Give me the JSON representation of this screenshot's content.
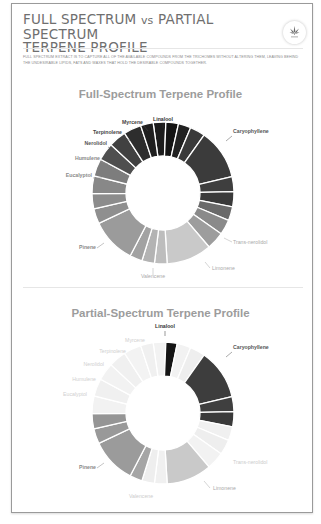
{
  "header": {
    "title_part1": "FULL SPECTRUM",
    "title_vs": "vs",
    "title_part2": "PARTIAL SPECTRUM",
    "title_line2": "TERPENE PROFILE",
    "logo_icon": "cannabis-leaf-icon",
    "description": "Full spectrum extract is to capture all of the available compounds from the trichomes without altering them, leaving behind the undesirable lipids, fats and waxes that hold the desirable compounds together."
  },
  "chart_data": [
    {
      "type": "pie",
      "variant": "donut",
      "title": "Full-Spectrum Terpene Profile",
      "start_angle_deg": -8,
      "segments": [
        {
          "label": "Linalool",
          "share": 10,
          "color": "#1c1c1c"
        },
        {
          "label": "Linalool",
          "share": 10,
          "color": "#141414"
        },
        {
          "label": "",
          "share": 10,
          "color": "#222222"
        },
        {
          "label": "",
          "share": 12,
          "color": "#3a3a3a"
        },
        {
          "label": "Caryophyllene",
          "share": 40,
          "color": "#3b3b3b"
        },
        {
          "label": "",
          "share": 12,
          "color": "#3e3e3e"
        },
        {
          "label": "",
          "share": 12,
          "color": "#3a3a3a"
        },
        {
          "label": "",
          "share": 11,
          "color": "#6a6a6a"
        },
        {
          "label": "",
          "share": 12,
          "color": "#8a8a8a"
        },
        {
          "label": "Trans-nerolidol",
          "share": 14,
          "color": "#9d9d9d"
        },
        {
          "label": "Limonene",
          "share": 36,
          "color": "#c9c9c9"
        },
        {
          "label": "",
          "share": 10,
          "color": "#bdbdbd"
        },
        {
          "label": "Valencene",
          "share": 10,
          "color": "#b3b3b3"
        },
        {
          "label": "",
          "share": 10,
          "color": "#a2a2a2"
        },
        {
          "label": "Pinene",
          "share": 36,
          "color": "#9b9b9b"
        },
        {
          "label": "",
          "share": 12,
          "color": "#8f8f8f"
        },
        {
          "label": "",
          "share": 12,
          "color": "#8c8c8c"
        },
        {
          "label": "Eucalyptol",
          "share": 14,
          "color": "#888888"
        },
        {
          "label": "Humulene",
          "share": 14,
          "color": "#7d7d7d"
        },
        {
          "label": "Nerolidol",
          "share": 14,
          "color": "#4f4f4f"
        },
        {
          "label": "Terpinolene",
          "share": 14,
          "color": "#414141"
        },
        {
          "label": "Myrcene",
          "share": 14,
          "color": "#2d2d2d"
        },
        {
          "label": "",
          "share": 10,
          "color": "#1f1f1f"
        }
      ],
      "labels": [
        {
          "text": "Linalool",
          "color": "#333333",
          "bold": true
        },
        {
          "text": "Caryophyllene",
          "color": "#555555",
          "bold": true
        },
        {
          "text": "Myrcene",
          "color": "#444444",
          "bold": true
        },
        {
          "text": "Terpinolene",
          "color": "#444444",
          "bold": true
        },
        {
          "text": "Nerolidol",
          "color": "#555555",
          "bold": true
        },
        {
          "text": "Humulene",
          "color": "#8a8a8a",
          "bold": true
        },
        {
          "text": "Eucalyptol",
          "color": "#8a8a8a",
          "bold": true
        },
        {
          "text": "Pinene",
          "color": "#8a8a8a",
          "bold": true
        },
        {
          "text": "Valencene",
          "color": "#aaaaaa",
          "bold": false
        },
        {
          "text": "Limonene",
          "color": "#aaaaaa",
          "bold": false
        },
        {
          "text": "Trans-nerolidol",
          "color": "#aaaaaa",
          "bold": false
        }
      ]
    },
    {
      "type": "pie",
      "variant": "donut",
      "title": "Partial-Spectrum Terpene Profile",
      "start_angle_deg": -8,
      "segments": [
        {
          "label": "",
          "share": 10,
          "color": "#f2f2f2"
        },
        {
          "label": "Linalool",
          "share": 9,
          "color": "#151515"
        },
        {
          "label": "",
          "share": 11,
          "color": "#f2f2f2"
        },
        {
          "label": "",
          "share": 12,
          "color": "#eeeeee"
        },
        {
          "label": "Caryophyllene",
          "share": 40,
          "color": "#3d3d3d"
        },
        {
          "label": "",
          "share": 12,
          "color": "#3f3f3f"
        },
        {
          "label": "",
          "share": 12,
          "color": "#3a3a3a"
        },
        {
          "label": "",
          "share": 11,
          "color": "#f0f0f0"
        },
        {
          "label": "",
          "share": 12,
          "color": "#eeeeee"
        },
        {
          "label": "Trans-nerolidol",
          "share": 14,
          "color": "#f2f2f2"
        },
        {
          "label": "Limonene",
          "share": 36,
          "color": "#c9c9c9"
        },
        {
          "label": "",
          "share": 10,
          "color": "#f0f0f0"
        },
        {
          "label": "Valencene",
          "share": 10,
          "color": "#eeeeee"
        },
        {
          "label": "",
          "share": 10,
          "color": "#a5a5a5"
        },
        {
          "label": "Pinene",
          "share": 36,
          "color": "#9b9b9b"
        },
        {
          "label": "",
          "share": 12,
          "color": "#999999"
        },
        {
          "label": "",
          "share": 12,
          "color": "#959595"
        },
        {
          "label": "Eucalyptol",
          "share": 14,
          "color": "#f2f2f2"
        },
        {
          "label": "Humulene",
          "share": 14,
          "color": "#f0f0f0"
        },
        {
          "label": "Nerolidol",
          "share": 14,
          "color": "#f2f2f2"
        },
        {
          "label": "Terpinolene",
          "share": 14,
          "color": "#f0f0f0"
        },
        {
          "label": "Myrcene",
          "share": 14,
          "color": "#f3f3f3"
        },
        {
          "label": "",
          "share": 10,
          "color": "#f0f0f0"
        }
      ],
      "labels": [
        {
          "text": "Linalool",
          "color": "#333333",
          "bold": true
        },
        {
          "text": "Caryophyllene",
          "color": "#555555",
          "bold": true
        },
        {
          "text": "Myrcene",
          "color": "#d0d0d0",
          "bold": false
        },
        {
          "text": "Terpinolene",
          "color": "#d0d0d0",
          "bold": false
        },
        {
          "text": "Nerolidol",
          "color": "#d0d0d0",
          "bold": false
        },
        {
          "text": "Humulene",
          "color": "#d0d0d0",
          "bold": false
        },
        {
          "text": "Eucalyptol",
          "color": "#d0d0d0",
          "bold": false
        },
        {
          "text": "Pinene",
          "color": "#8a8a8a",
          "bold": true
        },
        {
          "text": "Valencene",
          "color": "#cccccc",
          "bold": false
        },
        {
          "text": "Limonene",
          "color": "#aaaaaa",
          "bold": false
        },
        {
          "text": "Trans-nerolidol",
          "color": "#cccccc",
          "bold": false
        }
      ]
    }
  ]
}
